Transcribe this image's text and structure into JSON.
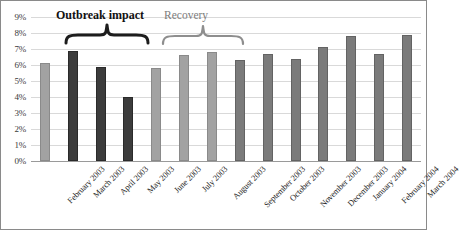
{
  "chart_data": {
    "type": "bar",
    "title": "",
    "xlabel": "",
    "ylabel": "",
    "ylim": [
      0,
      9
    ],
    "grid": true,
    "legend": "none",
    "y_tick_labels": [
      "9%",
      "8%",
      "7%",
      "6%",
      "5%",
      "4%",
      "3%",
      "2%",
      "1%",
      "0%"
    ],
    "y_ticks": [
      9,
      8,
      7,
      6,
      5,
      4,
      3,
      2,
      1,
      0
    ],
    "categories": [
      "February 2003",
      "March 2003",
      "April 2003",
      "May 2003",
      "June 2003",
      "July 2003",
      "August 2003",
      "September 2003",
      "October 2003",
      "November 2003",
      "December 2003",
      "January 2004",
      "February 2004",
      "March 2004"
    ],
    "values": [
      6.1,
      6.9,
      5.9,
      4.0,
      5.8,
      6.6,
      6.8,
      6.3,
      6.7,
      6.4,
      7.1,
      7.8,
      6.7,
      7.9
    ],
    "bar_shades": [
      "light",
      "dark",
      "dark",
      "dark",
      "light",
      "light",
      "light",
      "mid",
      "mid",
      "mid",
      "mid",
      "mid",
      "mid",
      "mid"
    ],
    "colors": {
      "dark": "#3c3c3c",
      "light": "#a2a2a2",
      "mid": "#7b7b7b",
      "gridline": "#d9d9d9",
      "axis": "#9a9a9a",
      "annotation_primary": "#111111",
      "annotation_secondary": "#7c7c7c"
    },
    "annotations": [
      {
        "name": "outbreak-impact",
        "label": "Outbreak impact",
        "spans_categories": [
          "March 2003",
          "April 2003",
          "May 2003"
        ],
        "emphasis": "bold"
      },
      {
        "name": "recovery",
        "label": "Recovery",
        "spans_categories": [
          "June 2003",
          "July 2003",
          "August 2003"
        ],
        "emphasis": "normal"
      }
    ]
  }
}
